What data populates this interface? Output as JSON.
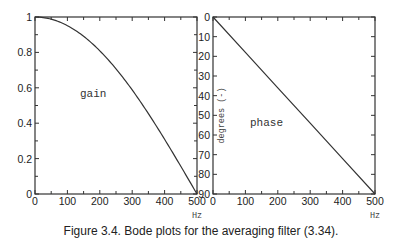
{
  "caption": "Figure 3.4. Bode plots for the averaging filter (3.34).",
  "chart_data": [
    {
      "type": "line",
      "title": "",
      "annotation": "gain",
      "xlabel": "Hz",
      "ylabel": "",
      "xlim": [
        0,
        500
      ],
      "ylim": [
        0,
        1
      ],
      "x_ticks": [
        0,
        100,
        200,
        300,
        400,
        500
      ],
      "y_ticks": [
        0,
        0.2,
        0.4,
        0.6,
        0.8,
        1
      ],
      "y_tick_labels": [
        "0",
        "0.2",
        "0.4",
        "0.6",
        "0.8",
        "1"
      ],
      "grid": false,
      "series": [
        {
          "name": "gain",
          "x": [
            0,
            50,
            100,
            150,
            200,
            250,
            300,
            350,
            400,
            450,
            500
          ],
          "y": [
            1.0,
            0.988,
            0.951,
            0.891,
            0.809,
            0.707,
            0.588,
            0.454,
            0.309,
            0.156,
            0.0
          ]
        }
      ]
    },
    {
      "type": "line",
      "title": "",
      "annotation": "phase",
      "xlabel": "Hz",
      "ylabel": "degrees (-)",
      "xlim": [
        0,
        500
      ],
      "ylim": [
        0,
        90
      ],
      "y_inverted": true,
      "x_ticks": [
        0,
        100,
        200,
        300,
        400,
        500
      ],
      "y_ticks": [
        0,
        10,
        20,
        30,
        40,
        50,
        60,
        70,
        80,
        90
      ],
      "grid": false,
      "series": [
        {
          "name": "phase",
          "x": [
            0,
            100,
            200,
            300,
            400,
            500
          ],
          "y": [
            0,
            18,
            36,
            54,
            72,
            90
          ]
        }
      ]
    }
  ]
}
